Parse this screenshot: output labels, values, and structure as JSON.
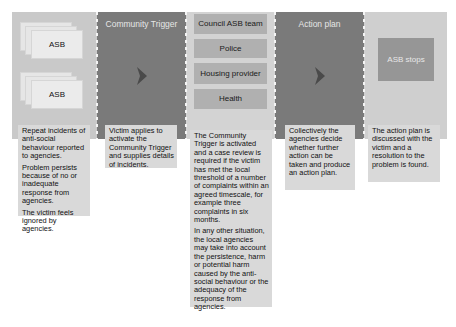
{
  "columns": [
    {
      "title": "",
      "stack_labels": [
        "ASB",
        "ASB"
      ],
      "description": [
        "Repeat incidents of anti-social behaviour reported to agencies.",
        "Problem persists because of no or inadequate response from agencies.",
        "The victim feels ignored by agencies."
      ]
    },
    {
      "title": "Community Trigger",
      "icon": "chevron-right-icon",
      "description": [
        "Victim applies to activate the Community Trigger and supplies details of incidents."
      ]
    },
    {
      "title": "",
      "agencies": [
        "Council ASB team",
        "Police",
        "Housing provider",
        "Health"
      ],
      "description": [
        "The Community Trigger is activated and a case review is required if the victim has met the local threshold of a number of complaints within an agreed timescale, for example three complaints in six months.",
        "In any other situation, the local agencies may take into account the persistence, harm or potential harm caused by the anti-social behaviour or the adequacy of the response from agencies."
      ]
    },
    {
      "title": "Action plan",
      "icon": "chevron-right-icon",
      "description": [
        "Collectively the agencies decide whether further action can be taken and produce an action plan."
      ]
    },
    {
      "title": "",
      "outcome_label": "ASB stops",
      "description": [
        "The action plan is discussed with the victim and a resolution to the problem is found."
      ]
    }
  ],
  "colors": {
    "light_panel": "#c9c9c9",
    "dark_panel": "#7a7a7a",
    "text_box": "#d9d9d9",
    "agency_box": "#b0b0b0",
    "outcome_box": "#969696",
    "chevron": "#4a4a4a"
  }
}
